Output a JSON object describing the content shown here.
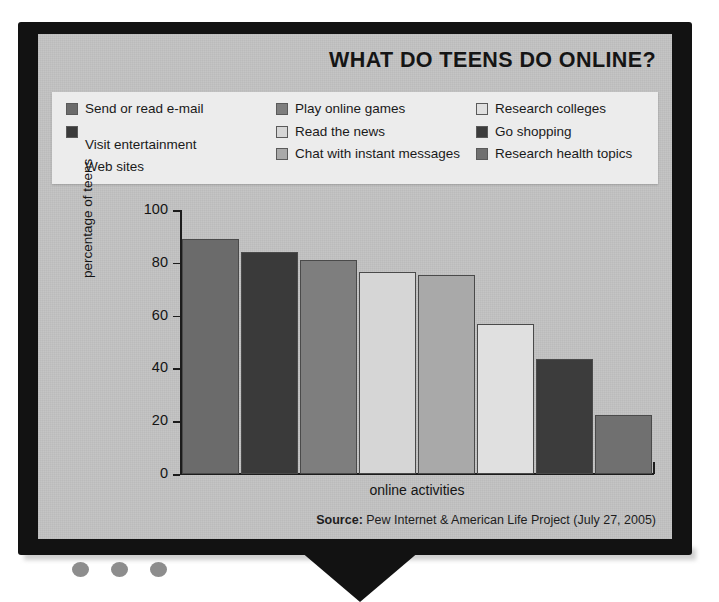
{
  "chart_data": {
    "type": "bar",
    "title": "WHAT DO TEENS DO ONLINE?",
    "xlabel": "online activities",
    "ylabel": "percentage of teens",
    "ylim": [
      0,
      100
    ],
    "yticks": [
      "100",
      "80",
      "60",
      "40",
      "20",
      "0"
    ],
    "grid": false,
    "legend_position": "top",
    "source_prefix": "Source:",
    "source_text": " Pew Internet & American Life Project (July 27, 2005)",
    "categories": [
      "Send or read e-mail",
      "Play online games",
      "Research colleges",
      "Read the news",
      "Visit entertainment Web sites",
      "Chat with instant messages",
      "Go shopping",
      "Research health topics"
    ],
    "values": [
      89,
      84,
      81,
      76.5,
      75.5,
      57,
      43.5,
      22.5
    ],
    "bar_colors": [
      "#6b6b6b",
      "#3a3a3a",
      "#7e7e7e",
      "#d6d6d6",
      "#a9a9a9",
      "#e0e0e0",
      "#3c3c3c",
      "#707070"
    ]
  },
  "legend": {
    "columns": [
      {
        "items": [
          {
            "label": "Send or read e-mail",
            "color": "#6b6b6b",
            "wrap": ""
          },
          {
            "label": "Visit entertainment",
            "color": "#3a3a3a",
            "wrap": "Web sites"
          }
        ]
      },
      {
        "items": [
          {
            "label": "Play online games",
            "color": "#7e7e7e",
            "wrap": ""
          },
          {
            "label": "Read the news",
            "color": "#d6d6d6",
            "wrap": ""
          },
          {
            "label": "Chat with instant messages",
            "color": "#a9a9a9",
            "wrap": ""
          }
        ]
      },
      {
        "items": [
          {
            "label": "Research colleges",
            "color": "#e0e0e0",
            "wrap": ""
          },
          {
            "label": "Go shopping",
            "color": "#3c3c3c",
            "wrap": ""
          },
          {
            "label": "Research health topics",
            "color": "#707070",
            "wrap": ""
          }
        ]
      }
    ]
  },
  "device": {
    "indicator_count": 3,
    "indicator_color": "#8d8d8d",
    "bezel_color": "#121212",
    "screen_color": "#c3c3c3"
  }
}
